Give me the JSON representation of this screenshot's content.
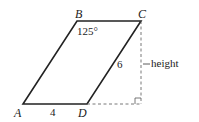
{
  "diagram": {
    "type": "parallelogram",
    "vertices": {
      "A": {
        "label": "A"
      },
      "B": {
        "label": "B"
      },
      "C": {
        "label": "C"
      },
      "D": {
        "label": "D"
      }
    },
    "angle_B": "125°",
    "side_AD": "4",
    "side_CD": "6",
    "height_label": "height"
  }
}
